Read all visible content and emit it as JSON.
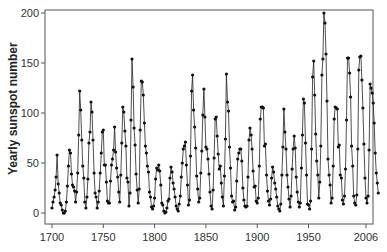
{
  "chart_data": {
    "type": "line",
    "title": "",
    "xlabel": "",
    "ylabel": "Yearly sunspot number",
    "xlim": [
      1700,
      2006
    ],
    "ylim": [
      0,
      200
    ],
    "x_ticks": [
      1700,
      1750,
      1800,
      1850,
      1900,
      1950,
      2006
    ],
    "y_ticks": [
      0,
      50,
      100,
      150,
      200
    ],
    "grid": false,
    "legend": null,
    "markers": true,
    "series": [
      {
        "name": "Yearly sunspot number",
        "x_start": 1700,
        "x_end": 2006,
        "values": [
          5,
          11,
          16,
          23,
          36,
          58,
          29,
          20,
          10,
          8,
          3,
          0,
          0,
          2,
          11,
          27,
          47,
          63,
          60,
          39,
          28,
          26,
          22,
          11,
          21,
          40,
          78,
          122,
          103,
          73,
          47,
          35,
          11,
          5,
          16,
          34,
          70,
          81,
          111,
          101,
          73,
          40,
          20,
          16,
          5,
          11,
          22,
          40,
          60,
          81,
          83,
          48,
          48,
          31,
          12,
          10,
          10,
          32,
          48,
          54,
          63,
          86,
          61,
          45,
          36,
          21,
          11,
          38,
          70,
          106,
          101,
          82,
          67,
          35,
          31,
          7,
          20,
          93,
          154,
          126,
          85,
          68,
          39,
          23,
          10,
          24,
          83,
          132,
          131,
          118,
          90,
          67,
          60,
          47,
          41,
          21,
          16,
          6,
          4,
          7,
          15,
          34,
          45,
          43,
          48,
          42,
          28,
          10,
          8,
          2,
          0,
          1,
          5,
          12,
          14,
          35,
          46,
          41,
          30,
          24,
          16,
          7,
          4,
          2,
          9,
          17,
          36,
          50,
          64,
          67,
          71,
          48,
          28,
          8,
          13,
          57,
          122,
          138,
          103,
          86,
          65,
          37,
          24,
          11,
          15,
          40,
          62,
          98,
          124,
          96,
          66,
          64,
          54,
          39,
          21,
          7,
          4,
          23,
          55,
          94,
          96,
          77,
          59,
          44,
          47,
          30,
          16,
          7,
          37,
          74,
          139,
          111,
          102,
          66,
          45,
          17,
          11,
          12,
          3,
          6,
          32,
          54,
          60,
          64,
          64,
          52,
          25,
          13,
          7,
          6,
          7,
          36,
          73,
          85,
          78,
          64,
          42,
          26,
          27,
          12,
          10,
          15,
          47,
          94,
          106,
          106,
          105,
          67,
          69,
          38,
          22,
          12,
          8,
          14,
          35,
          46,
          41,
          30,
          24,
          16,
          7,
          4,
          2,
          9,
          38,
          66,
          104,
          81,
          64,
          38,
          26,
          14,
          6,
          17,
          44,
          64,
          77,
          65,
          36,
          21,
          11,
          6,
          10,
          45,
          78,
          114,
          110,
          70,
          38,
          9,
          8,
          4,
          12,
          64,
          136,
          152,
          118,
          79,
          52,
          38,
          15,
          31,
          67,
          138,
          154,
          200,
          190,
          159,
          112,
          54,
          38,
          28,
          10,
          15,
          47,
          94,
          106,
          105,
          104,
          66,
          68,
          38,
          35,
          13,
          9,
          17,
          44,
          93,
          155,
          155,
          140,
          116,
          67,
          47,
          17,
          10,
          8,
          18,
          64,
          143,
          156,
          157,
          133,
          105,
          69,
          35,
          15,
          10,
          17,
          63,
          129,
          125,
          120,
          110,
          90,
          60,
          40,
          30,
          20
        ]
      }
    ]
  }
}
